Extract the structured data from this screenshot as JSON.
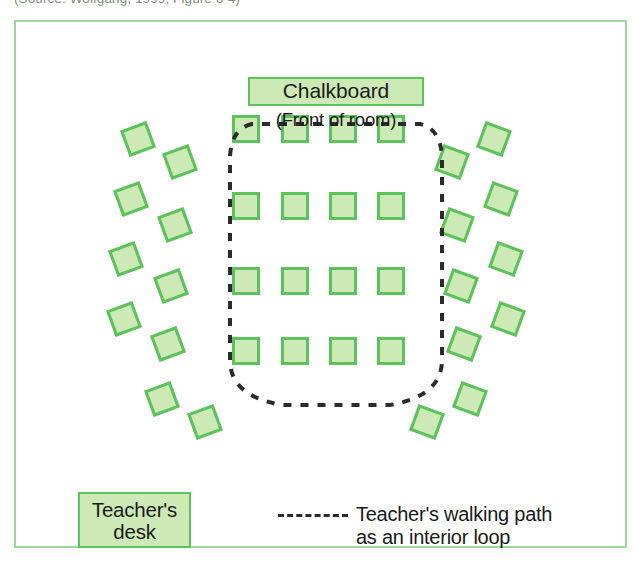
{
  "source_credit": "(Source: Wolfgang, 1999, Figure 6-4)",
  "diagram": {
    "chalkboard_label": "Chalkboard",
    "front_of_room_label": "(Front of room)",
    "teacher_desk_label_line1": "Teacher's",
    "teacher_desk_label_line2": "desk",
    "legend": {
      "line_style": "dashed",
      "text": "Teacher's walking path\nas an interior loop"
    },
    "colors": {
      "desk_fill": "#cdeab6",
      "desk_border": "#5cc25c",
      "frame_border": "#9ed79b",
      "path_line": "#2b2b2b",
      "text": "#1a1a1a"
    },
    "counts": {
      "interior_desks": 16,
      "left_block_desks": 8,
      "right_block_desks": 8,
      "bottom_left_desks": 2,
      "bottom_right_desks": 2,
      "total_desks": 36
    },
    "interior_grid": {
      "rows": 4,
      "columns": 4
    }
  },
  "desks": {
    "interior": [
      {
        "x": 232,
        "y": 115,
        "rot": 0
      },
      {
        "x": 281,
        "y": 115,
        "rot": 0
      },
      {
        "x": 329,
        "y": 115,
        "rot": 0
      },
      {
        "x": 377,
        "y": 115,
        "rot": 0
      },
      {
        "x": 232,
        "y": 192,
        "rot": 0
      },
      {
        "x": 281,
        "y": 192,
        "rot": 0
      },
      {
        "x": 329,
        "y": 192,
        "rot": 0
      },
      {
        "x": 377,
        "y": 192,
        "rot": 0
      },
      {
        "x": 232,
        "y": 267,
        "rot": 0
      },
      {
        "x": 281,
        "y": 267,
        "rot": 0
      },
      {
        "x": 329,
        "y": 267,
        "rot": 0
      },
      {
        "x": 377,
        "y": 267,
        "rot": 0
      },
      {
        "x": 232,
        "y": 337,
        "rot": 0
      },
      {
        "x": 281,
        "y": 337,
        "rot": 0
      },
      {
        "x": 329,
        "y": 337,
        "rot": 0
      },
      {
        "x": 377,
        "y": 337,
        "rot": 0
      }
    ],
    "left_block": [
      {
        "x": 124,
        "y": 125,
        "rot": -20
      },
      {
        "x": 166,
        "y": 148,
        "rot": -20
      },
      {
        "x": 117,
        "y": 185,
        "rot": -20
      },
      {
        "x": 161,
        "y": 211,
        "rot": -20
      },
      {
        "x": 112,
        "y": 245,
        "rot": -20
      },
      {
        "x": 157,
        "y": 272,
        "rot": -20
      },
      {
        "x": 110,
        "y": 305,
        "rot": -20
      },
      {
        "x": 154,
        "y": 330,
        "rot": -20
      }
    ],
    "right_block": [
      {
        "x": 480,
        "y": 125,
        "rot": 20
      },
      {
        "x": 438,
        "y": 148,
        "rot": 20
      },
      {
        "x": 487,
        "y": 185,
        "rot": 20
      },
      {
        "x": 443,
        "y": 211,
        "rot": 20
      },
      {
        "x": 492,
        "y": 245,
        "rot": 20
      },
      {
        "x": 447,
        "y": 272,
        "rot": 20
      },
      {
        "x": 494,
        "y": 305,
        "rot": 20
      },
      {
        "x": 450,
        "y": 330,
        "rot": 20
      }
    ],
    "bottom_left": [
      {
        "x": 148,
        "y": 385,
        "rot": -20
      },
      {
        "x": 191,
        "y": 408,
        "rot": -20
      }
    ],
    "bottom_right": [
      {
        "x": 456,
        "y": 385,
        "rot": 20
      },
      {
        "x": 413,
        "y": 408,
        "rot": 20
      }
    ]
  }
}
